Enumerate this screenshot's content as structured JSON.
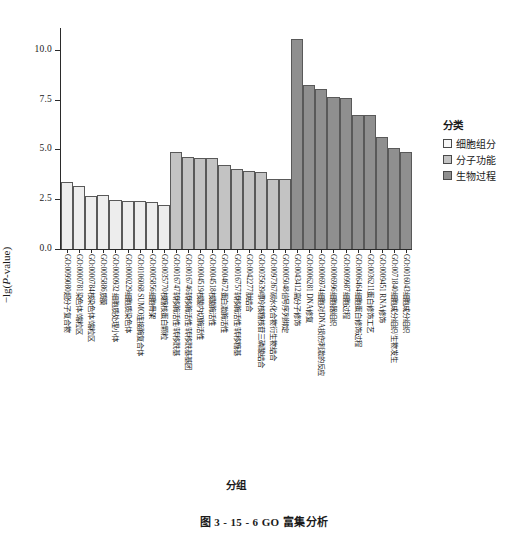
{
  "figure": {
    "caption": "图 3 - 15 - 6    GO 富集分析"
  },
  "chart_data": {
    "type": "bar",
    "title": "",
    "xlabel": "分组",
    "ylabel": "−lg(P-value)",
    "ylim": [
      0,
      11.1
    ],
    "yticks": [
      "0.0",
      "2.5",
      "5.0",
      "7.5",
      "10.0"
    ],
    "ytick_values": [
      0.0,
      2.5,
      5.0,
      7.5,
      10.0
    ],
    "grid": false,
    "legend": {
      "title": "分类",
      "position": "right",
      "entries": [
        {
          "label": "细胞组分",
          "color": "#f7f7f7"
        },
        {
          "label": "分子功能",
          "color": "#c3c3c3"
        },
        {
          "label": "生物过程",
          "color": "#8f8f8f"
        }
      ]
    },
    "categories": [
      "GO:0099080超分子复合物",
      "GO:0000781染色体/端粒区",
      "GO:0000784核染色体/端粒区",
      "GO:0005886质膜",
      "GO:0000932 细胞质处理小体",
      "GO:0000229细胞质染色体",
      "GO:0106068 SUMO连接酶复合体",
      "GO:0005856细胞骨架",
      "GO:0035770核糖核蛋白颗粒",
      "GO:0016747转移酶活性/转移酰基",
      "GO:0016746转移酶活性/转移酰基基团",
      "GO:0004519核酸内切酶活性",
      "GO:0004518核酸酶活性",
      "GO:0004672蛋白激酶活性",
      "GO:0016757转移酶活性/转移糖基",
      "GO:0042277肽结合",
      "GO:0035639嘌呤核糖核苷三磷酸结合",
      "GO:0097367碳水化合物衍生物结合",
      "GO:0005048信号序列绑定",
      "GO:0043412高分子修饰",
      "GO:0006281 DNA修复",
      "GO:0006974细胞对DNA损伤刺激的反应",
      "GO:0006996细胞器组织",
      "GO:0009987细胞过程",
      "GO:0006464细胞蛋白修饰过程",
      "GO:0036211蛋白修饰工艺",
      "GO:0009451 RNA修饰",
      "GO:0071840细胞成分组织/生物发生",
      "GO:0016043细胞成分组织"
    ],
    "values": [
      3.35,
      3.15,
      2.68,
      2.7,
      2.45,
      2.42,
      2.42,
      2.38,
      2.22,
      4.85,
      4.62,
      4.58,
      4.55,
      4.22,
      4.0,
      3.92,
      3.85,
      3.52,
      3.52,
      10.55,
      8.22,
      8.05,
      7.62,
      7.58,
      6.75,
      6.75,
      5.65,
      5.05,
      4.85
    ],
    "groups": [
      "cc",
      "cc",
      "cc",
      "cc",
      "cc",
      "cc",
      "cc",
      "cc",
      "cc",
      "mf",
      "mf",
      "mf",
      "mf",
      "mf",
      "mf",
      "mf",
      "mf",
      "mf",
      "mf",
      "bp",
      "bp",
      "bp",
      "bp",
      "bp",
      "bp",
      "bp",
      "bp",
      "bp",
      "bp"
    ]
  }
}
